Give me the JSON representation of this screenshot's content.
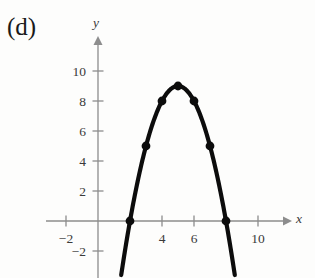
{
  "panel": {
    "label": "(d)"
  },
  "chart_data": {
    "type": "scatter",
    "title": "",
    "subtitle": "",
    "xlabel": "x",
    "ylabel": "y",
    "grid": false,
    "legend": null,
    "xlim": [
      -3.2,
      11.8
    ],
    "ylim": [
      -3.3,
      10.9
    ],
    "xticks": [
      -2,
      4,
      6,
      10
    ],
    "xtick_labels": [
      "−2",
      "4",
      "6",
      "10"
    ],
    "yticks": [
      -2,
      2,
      4,
      6,
      8,
      10
    ],
    "ytick_labels": [
      "−2",
      "2",
      "4",
      "6",
      "8",
      "10"
    ],
    "curve": {
      "equation": "y = -(x - 5)^2 + 9",
      "vertex": [
        5,
        9
      ],
      "x_range": [
        1.45,
        8.55
      ],
      "roots": [
        2,
        8
      ],
      "style": "solid-thick-black"
    },
    "points": [
      {
        "x": 2,
        "y": 0
      },
      {
        "x": 3,
        "y": 5
      },
      {
        "x": 4,
        "y": 8
      },
      {
        "x": 5,
        "y": 9
      },
      {
        "x": 6,
        "y": 8
      },
      {
        "x": 7,
        "y": 5
      },
      {
        "x": 8,
        "y": 0
      }
    ],
    "colors": {
      "curve": "#0c0c0c",
      "points": "#0c0c0c",
      "axes": "#8d8d8d",
      "text": "#3a3a3a",
      "background": "#fdfdfc"
    },
    "axis_pixel_mapping": {
      "x_origin_px": 98,
      "y_origin_px": 221,
      "x_unit_px": 16,
      "y_unit_px": 15
    }
  }
}
